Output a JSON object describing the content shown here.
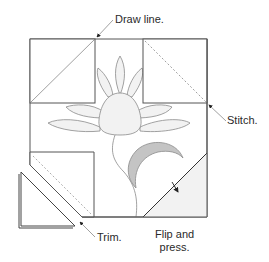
{
  "diagram": {
    "labels": {
      "draw_line": "Draw line.",
      "stitch": "Stitch.",
      "trim": "Trim.",
      "flip_press_line1": "Flip and",
      "flip_press_line2": "press."
    },
    "colors": {
      "outline": "#555555",
      "petal_fill": "#f0f0f0",
      "petal_stroke": "#8a8a8a",
      "crescent_fill": "#c4c4c4",
      "pressed_fill": "#f2f2f2",
      "stitch_dash": "#888888",
      "leader": "#333333"
    },
    "elements": [
      "background-block",
      "corner-square-top-left",
      "corner-square-top-right",
      "corner-square-bottom-left",
      "trimmed-triangle",
      "pressed-triangle-bottom-right",
      "lotus-flower",
      "stem",
      "crescent-leaf"
    ]
  }
}
